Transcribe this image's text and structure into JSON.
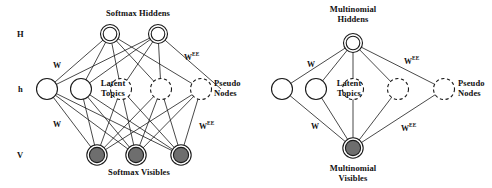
{
  "figure": {
    "type": "neural-network-diagram",
    "panel_count": 2,
    "colors": {
      "stroke": "#1a1a1a",
      "fill_solid_node": "#6e6e6e",
      "fill_open_node": "#ffffff",
      "background": "#ffffff"
    }
  },
  "axis_labels": {
    "hidden": "H",
    "latent": "h",
    "visible": "V"
  },
  "left_panel": {
    "top_title": "Softmax Hiddens",
    "bottom_title": "Softmax Visibles",
    "latent_label_line1": "Latent",
    "latent_label_line2": "Topics",
    "pseudo_label_line1": "Pseudo",
    "pseudo_label_line2": "Nodes",
    "weight_top": "W",
    "weight_bottom": "W",
    "weight_top_pseudo": "W",
    "weight_top_pseudo_sup": "EE",
    "weight_bottom_pseudo": "W",
    "weight_bottom_pseudo_sup": "EE",
    "hidden_nodes": 2,
    "latent_topic_nodes": 2,
    "pseudo_nodes": 3,
    "visible_nodes": 3
  },
  "right_panel": {
    "top_title_line1": "Multinomial",
    "top_title_line2": "Hiddens",
    "bottom_title_line1": "Multinomial",
    "bottom_title_line2": "Visibles",
    "latent_label_line1": "Latent",
    "latent_label_line2": "Topics",
    "pseudo_label_line1": "Pseudo",
    "pseudo_label_line2": "Nodes",
    "weight_top": "W",
    "weight_bottom": "W",
    "weight_top_pseudo": "W",
    "weight_top_pseudo_sup": "EE",
    "weight_bottom_pseudo": "W",
    "weight_bottom_pseudo_sup": "EE",
    "hidden_nodes": 1,
    "latent_topic_nodes": 2,
    "pseudo_nodes": 3,
    "visible_nodes": 1
  }
}
